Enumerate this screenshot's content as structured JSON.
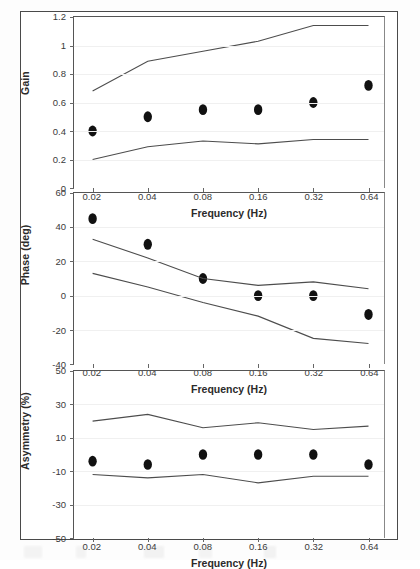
{
  "figure": {
    "xlabel": "Frequency (Hz)",
    "xticks": [
      "0.02",
      "0.04",
      "0.08",
      "0.16",
      "0.32",
      "0.64"
    ],
    "x_values": [
      0.02,
      0.04,
      0.08,
      0.16,
      0.32,
      0.64
    ],
    "panel_count": 3,
    "marker_style": "filled-circle",
    "band_style": "solid-line",
    "colors": {
      "marker": "#111111",
      "band": "#4d4d4d",
      "axis": "#555555",
      "grid": "#f0f0f0",
      "frame": "#4a4a4a",
      "background": "#ffffff"
    }
  },
  "chart_data": [
    {
      "type": "scatter",
      "id": "gain",
      "title": "",
      "xlabel": "Frequency (Hz)",
      "ylabel": "Gain",
      "x": [
        0.02,
        0.04,
        0.08,
        0.16,
        0.32,
        0.64
      ],
      "categories": [
        "0.02",
        "0.04",
        "0.08",
        "0.16",
        "0.32",
        "0.64"
      ],
      "xtick_labels": [
        "0.02",
        "0.04",
        "0.08",
        "0.16",
        "0.32",
        "0.64"
      ],
      "ytick_labels": [
        "0",
        "0.2",
        "0.4",
        "0.6",
        "0.8",
        "1",
        "1.2"
      ],
      "yticks": [
        0,
        0.2,
        0.4,
        0.6,
        0.8,
        1.0,
        1.2
      ],
      "ylim": [
        0,
        1.2
      ],
      "grid": true,
      "legend": "none",
      "series": [
        {
          "name": "data",
          "style": "markers",
          "values": [
            0.4,
            0.5,
            0.55,
            0.55,
            0.6,
            0.72
          ]
        },
        {
          "name": "upper-bound",
          "style": "line",
          "values": [
            0.68,
            0.89,
            0.96,
            1.03,
            1.14,
            1.14
          ]
        },
        {
          "name": "lower-bound",
          "style": "line",
          "values": [
            0.2,
            0.29,
            0.33,
            0.31,
            0.34,
            0.34
          ]
        }
      ]
    },
    {
      "type": "scatter",
      "id": "phase",
      "title": "",
      "xlabel": "Frequency (Hz)",
      "ylabel": "Phase (deg)",
      "x": [
        0.02,
        0.04,
        0.08,
        0.16,
        0.32,
        0.64
      ],
      "categories": [
        "0.02",
        "0.04",
        "0.08",
        "0.16",
        "0.32",
        "0.64"
      ],
      "xtick_labels": [
        "0.02",
        "0.04",
        "0.08",
        "0.16",
        "0.32",
        "0.64"
      ],
      "ytick_labels": [
        "-40",
        "-20",
        "0",
        "20",
        "40",
        "60"
      ],
      "yticks": [
        -40,
        -20,
        0,
        20,
        40,
        60
      ],
      "ylim": [
        -40,
        60
      ],
      "grid": true,
      "legend": "none",
      "series": [
        {
          "name": "data",
          "style": "markers",
          "values": [
            45,
            30,
            10,
            0,
            0,
            -11
          ]
        },
        {
          "name": "upper-bound",
          "style": "line",
          "values": [
            33,
            22,
            10,
            6,
            8,
            4
          ]
        },
        {
          "name": "lower-bound",
          "style": "line",
          "values": [
            13,
            5,
            -4,
            -12,
            -25,
            -28
          ]
        }
      ]
    },
    {
      "type": "scatter",
      "id": "asymmetry",
      "title": "",
      "xlabel": "Frequency (Hz)",
      "ylabel": "Asymmetry (%)",
      "x": [
        0.02,
        0.04,
        0.08,
        0.16,
        0.32,
        0.64
      ],
      "categories": [
        "0.02",
        "0.04",
        "0.08",
        "0.16",
        "0.32",
        "0.64"
      ],
      "xtick_labels": [
        "0.02",
        "0.04",
        "0.08",
        "0.16",
        "0.32",
        "0.64"
      ],
      "ytick_labels": [
        "-50",
        "-30",
        "-10",
        "10",
        "30",
        "50"
      ],
      "yticks": [
        -50,
        -30,
        -10,
        10,
        30,
        50
      ],
      "ylim": [
        -50,
        50
      ],
      "grid": true,
      "legend": "none",
      "series": [
        {
          "name": "data",
          "style": "markers",
          "values": [
            -4,
            -6,
            0,
            0,
            0,
            -6
          ]
        },
        {
          "name": "upper-bound",
          "style": "line",
          "values": [
            20,
            24,
            16,
            19,
            15,
            17
          ]
        },
        {
          "name": "lower-bound",
          "style": "line",
          "values": [
            -12,
            -14,
            -12,
            -17,
            -13,
            -13
          ]
        }
      ]
    }
  ]
}
